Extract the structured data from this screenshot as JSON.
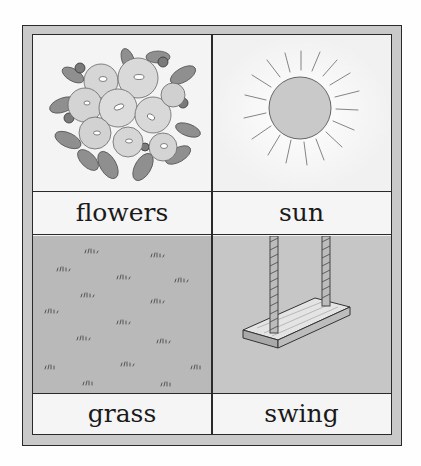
{
  "card": {
    "cells": [
      {
        "label": "flowers",
        "icon": "flowers-illustration"
      },
      {
        "label": "sun",
        "icon": "sun-illustration"
      },
      {
        "label": "grass",
        "icon": "grass-illustration"
      },
      {
        "label": "swing",
        "icon": "swing-illustration"
      }
    ]
  },
  "colors": {
    "frame": "#c9c9c9",
    "border": "#2a2a2a",
    "paper": "#f3f3f3",
    "grass": "#b9b9b9",
    "swing_bg": "#c6c6c6",
    "sun_fill": "#c9c9c9"
  }
}
